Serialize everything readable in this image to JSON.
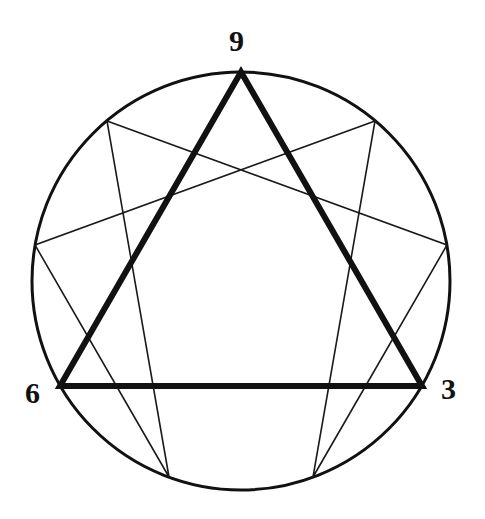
{
  "figure": {
    "name": "enneagram-symbol",
    "background_color": "#ffffff",
    "ink_color": "#111111",
    "canvas": {
      "width": 485,
      "height": 519
    }
  },
  "circle": {
    "name": "outer-circle",
    "center_x": 241,
    "center_y": 281,
    "radius": 209,
    "stroke_width": 3,
    "stroke_color": "#111111",
    "fill": "none"
  },
  "labels": [
    {
      "id": "9",
      "text": "9",
      "x": 229,
      "y": 26,
      "font_size": 30,
      "bold": true
    },
    {
      "id": "6",
      "text": "6",
      "x": 25,
      "y": 378,
      "font_size": 30,
      "bold": true
    },
    {
      "id": "3",
      "text": "3",
      "x": 441,
      "y": 374,
      "font_size": 30,
      "bold": true
    }
  ],
  "nodes": [
    {
      "id": "9",
      "angle_deg": 270,
      "x": 241,
      "y": 72,
      "labeled": true
    },
    {
      "id": "1",
      "angle_deg": 310,
      "x": 375,
      "y": 121,
      "labeled": false
    },
    {
      "id": "2",
      "angle_deg": 350,
      "x": 447,
      "y": 245,
      "labeled": false
    },
    {
      "id": "3",
      "angle_deg": 30,
      "x": 422,
      "y": 386,
      "labeled": true
    },
    {
      "id": "4",
      "angle_deg": 70,
      "x": 313,
      "y": 477,
      "labeled": false
    },
    {
      "id": "5",
      "angle_deg": 110,
      "x": 169,
      "y": 477,
      "labeled": false
    },
    {
      "id": "6",
      "angle_deg": 150,
      "x": 60,
      "y": 386,
      "labeled": true
    },
    {
      "id": "7",
      "angle_deg": 190,
      "x": 35,
      "y": 245,
      "labeled": false
    },
    {
      "id": "8",
      "angle_deg": 230,
      "x": 107,
      "y": 121,
      "labeled": false
    }
  ],
  "triangle": {
    "name": "inner-triangle-9-3-6",
    "vertices": [
      "9",
      "3",
      "6"
    ],
    "points": "241,72 422,386 60,386",
    "stroke_width": 6,
    "stroke_color": "#111111",
    "fill": "none"
  },
  "hexad": {
    "name": "hexad-path-1-4-2-8-5-7",
    "sequence": [
      "1",
      "4",
      "2",
      "8",
      "5",
      "7"
    ],
    "points": "375,121 313,477 447,245 107,121 169,477 35,245",
    "stroke_width": 1.6,
    "stroke_color": "#1a1a1a",
    "fill": "none",
    "closed": true
  },
  "chart_data": {
    "type": "diagram",
    "visible_labels": [
      "9",
      "6",
      "3"
    ],
    "shapes": [
      "circle",
      "equilateral-triangle",
      "irregular-hexagram"
    ]
  }
}
